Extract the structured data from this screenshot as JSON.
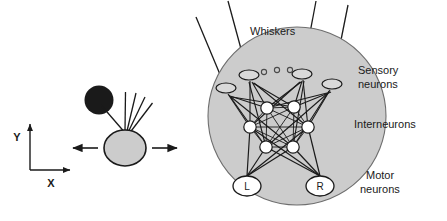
{
  "figure": {
    "title_text": "Whiskers",
    "labels": {
      "whiskers": "Whiskers",
      "sensory_line1": "Sensory",
      "sensory_line2": "neurons",
      "interneurons": "Interneurons",
      "motor_line1": "Motor",
      "motor_line2": "neurons",
      "axis_x": "X",
      "axis_y": "Y"
    },
    "colors": {
      "body_fill": "#cccccc",
      "obstacle_fill": "#1a1a1a",
      "neuron_fill": "#ffffff",
      "stroke": "#1a1a1a",
      "text": "#1a1a1a",
      "background": "#ffffff"
    },
    "left_panel": {
      "name": "agent-schematic",
      "body": {
        "cx": 125,
        "cy": 148,
        "rx": 21,
        "ry": 18,
        "fill": "#cccccc"
      },
      "obstacle": {
        "cx": 99,
        "cy": 100,
        "r": 14,
        "fill": "#1a1a1a"
      },
      "whiskers": [
        {
          "x1": 123,
          "y1": 131,
          "x2": 100,
          "y2": 104
        },
        {
          "x1": 125,
          "y1": 131,
          "x2": 126,
          "y2": 92
        },
        {
          "x1": 127,
          "y1": 131,
          "x2": 136,
          "y2": 93
        },
        {
          "x1": 129,
          "y1": 131,
          "x2": 145,
          "y2": 97
        },
        {
          "x1": 130,
          "y1": 132,
          "x2": 152,
          "y2": 103
        }
      ],
      "motion_arrows": [
        {
          "name": "arrow-left",
          "x1": 98,
          "y1": 148,
          "x2": 72,
          "y2": 148
        },
        {
          "name": "arrow-right",
          "x1": 152,
          "y1": 148,
          "x2": 178,
          "y2": 148
        }
      ],
      "axes": {
        "origin": {
          "x": 30,
          "y": 170
        },
        "x_tip": {
          "x": 72,
          "y": 170
        },
        "y_tip": {
          "x": 30,
          "y": 122
        },
        "x_label_pos": {
          "x": 51,
          "y": 186
        },
        "y_label_pos": {
          "x": 16,
          "y": 140
        }
      }
    },
    "right_panel": {
      "name": "neural-circuit",
      "body_circle": {
        "cx": 297,
        "cy": 116,
        "r": 89,
        "fill": "#cccccc"
      },
      "sensory_neurons": [
        {
          "id": "s1",
          "cx": 226,
          "cy": 88,
          "rx": 10,
          "ry": 5
        },
        {
          "id": "s2",
          "cx": 249,
          "cy": 75,
          "rx": 10,
          "ry": 5
        },
        {
          "id": "s3",
          "cx": 302,
          "cy": 74,
          "rx": 10,
          "ry": 5
        },
        {
          "id": "s4",
          "cx": 332,
          "cy": 84,
          "rx": 10,
          "ry": 5
        }
      ],
      "ellipsis_dots": [
        {
          "cx": 264,
          "cy": 72,
          "r": 2.5
        },
        {
          "cx": 277,
          "cy": 70,
          "r": 2.5
        },
        {
          "cx": 290,
          "cy": 70,
          "r": 2.5
        }
      ],
      "whisker_lines": [
        {
          "x1": 224,
          "y1": 84,
          "x2": 196,
          "y2": 18
        },
        {
          "x1": 247,
          "y1": 71,
          "x2": 228,
          "y2": 2
        },
        {
          "x1": 303,
          "y1": 70,
          "x2": 315,
          "y2": 2
        },
        {
          "x1": 333,
          "y1": 80,
          "x2": 347,
          "y2": 6
        }
      ],
      "interneurons": [
        {
          "id": "i1",
          "cx": 267,
          "cy": 108,
          "r": 6
        },
        {
          "id": "i2",
          "cx": 294,
          "cy": 107,
          "r": 6
        },
        {
          "id": "i3",
          "cx": 250,
          "cy": 127,
          "r": 6
        },
        {
          "id": "i4",
          "cx": 308,
          "cy": 127,
          "r": 6
        },
        {
          "id": "i5",
          "cx": 266,
          "cy": 147,
          "r": 6
        },
        {
          "id": "i6",
          "cx": 293,
          "cy": 147,
          "r": 6
        }
      ],
      "motor_neurons": [
        {
          "id": "L",
          "label": "L",
          "cx": 247,
          "cy": 186,
          "rx": 14,
          "ry": 10
        },
        {
          "id": "R",
          "label": "R",
          "cx": 320,
          "cy": 186,
          "rx": 14,
          "ry": 10
        }
      ],
      "label_positions": {
        "whiskers": {
          "x": 250,
          "y": 34
        },
        "sensory": {
          "x": 358,
          "y": 74
        },
        "interneurons": {
          "x": 354,
          "y": 125
        },
        "motor": {
          "x": 366,
          "y": 178
        }
      }
    }
  }
}
